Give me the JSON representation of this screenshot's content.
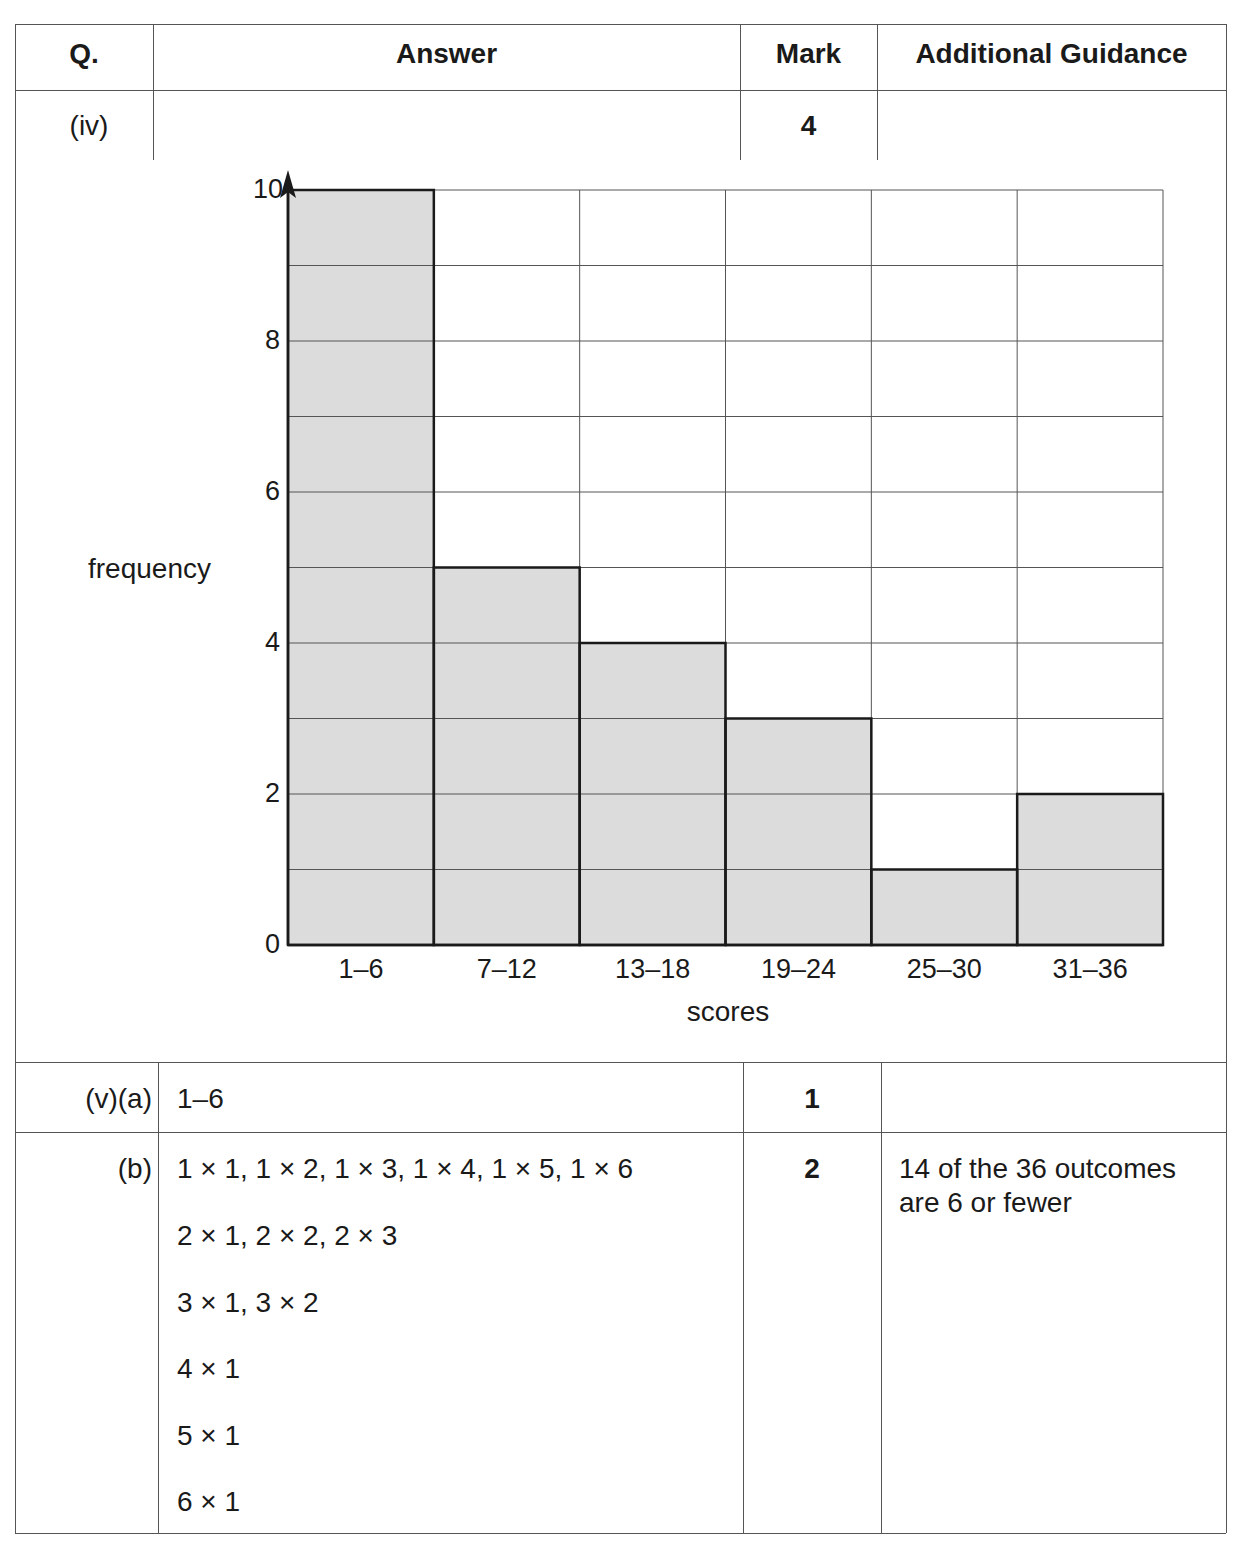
{
  "table": {
    "headers": {
      "q": "Q.",
      "answer": "Answer",
      "mark": "Mark",
      "guidance": "Additional Guidance"
    },
    "rows": [
      {
        "q": "(iv)",
        "answer": "",
        "mark": "4",
        "guidance": ""
      },
      {
        "q": "(v)(a)",
        "answer": "1–6",
        "mark": "1",
        "guidance": ""
      },
      {
        "q": "(b)",
        "answer_lines": [
          "1 × 1, 1 × 2, 1 × 3, 1 × 4, 1 × 5, 1 × 6",
          "2 × 1, 2 × 2, 2 × 3",
          "3 × 1, 3 × 2",
          "4 × 1",
          "5 × 1",
          "6 × 1"
        ],
        "mark": "2",
        "guidance_lines": [
          "14 of the 36 outcomes",
          "are 6 or fewer"
        ]
      }
    ]
  },
  "chart_data": {
    "type": "bar",
    "title": "",
    "categories": [
      "1–6",
      "7–12",
      "13–18",
      "19–24",
      "25–30",
      "31–36"
    ],
    "values": [
      10,
      5,
      4,
      3,
      1,
      2
    ],
    "xlabel": "scores",
    "ylabel": "frequency",
    "ylim": [
      0,
      10
    ],
    "yticks": [
      "0",
      "2",
      "4",
      "6",
      "8",
      "10"
    ],
    "grid": true,
    "grid_step": 1,
    "legend": "none",
    "bar_color": "#dcdcdc"
  }
}
